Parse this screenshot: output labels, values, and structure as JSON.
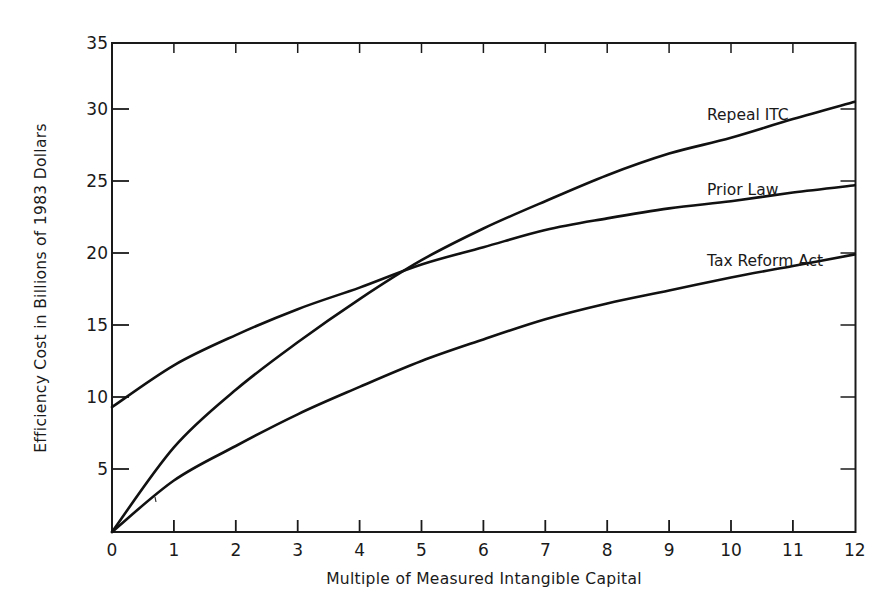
{
  "chart_data": {
    "type": "line",
    "title": "",
    "xlabel": "Multiple of Measured Intangible Capital",
    "ylabel": "Efficiency Cost in Billions of 1983 Dollars",
    "xlim": [
      0,
      12
    ],
    "ylim": [
      0,
      35
    ],
    "x_ticks": [
      "0",
      "1",
      "2",
      "3",
      "4",
      "5",
      "6",
      "7",
      "8",
      "9",
      "10",
      "11",
      "12"
    ],
    "y_ticks": [
      "5",
      "10",
      "15",
      "20",
      "25",
      "30",
      "35"
    ],
    "grid": false,
    "legend_position": "inline labels at right end of lines",
    "x": [
      0,
      1,
      2,
      3,
      4,
      5,
      6,
      7,
      8,
      9,
      10,
      11,
      12
    ],
    "series": [
      {
        "name": "Repeal ITC",
        "values": [
          0.6,
          6.5,
          10.5,
          13.8,
          16.8,
          19.5,
          21.7,
          23.6,
          25.4,
          26.9,
          28.0,
          29.3,
          30.5
        ]
      },
      {
        "name": "Prior Law",
        "values": [
          9.3,
          12.2,
          14.3,
          16.1,
          17.6,
          19.2,
          20.4,
          21.6,
          22.4,
          23.1,
          23.6,
          24.2,
          24.7
        ]
      },
      {
        "name": "Tax Reform Act",
        "values": [
          0.6,
          4.2,
          6.6,
          8.8,
          10.7,
          12.5,
          14.0,
          15.4,
          16.5,
          17.4,
          18.3,
          19.1,
          19.9
        ]
      }
    ],
    "annotations": [
      {
        "text": "Repeal ITC",
        "x": 9.3,
        "y": 31.5
      },
      {
        "text": "Prior Law",
        "x": 9.3,
        "y": 26.2
      },
      {
        "text": "Tax Reform Act",
        "x": 9.3,
        "y": 21.3
      }
    ]
  }
}
